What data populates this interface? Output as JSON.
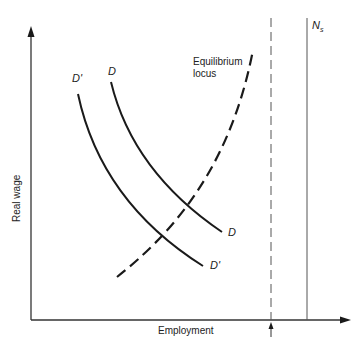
{
  "diagram": {
    "axes": {
      "x_label": "Employment",
      "y_label": "Real wage"
    },
    "curves": {
      "D_label_top": "D",
      "D_label_end": "D",
      "Dprime_label_top": "D'",
      "Dprime_label_end": "D'",
      "locus_label_line1": "Equilibrium",
      "locus_label_line2": "locus"
    },
    "vertical_lines": {
      "full_employment_label": "N",
      "full_employment_subscript": "s"
    }
  },
  "colors": {
    "line": "#1a1a1a",
    "axis": "#333333",
    "thin_line": "#555555"
  }
}
